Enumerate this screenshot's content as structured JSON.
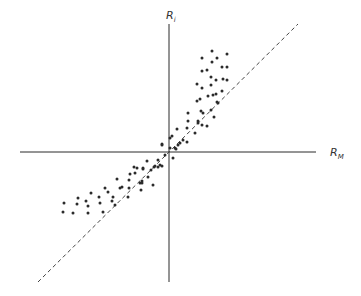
{
  "chart_data": {
    "type": "scatter",
    "title": "",
    "xlabel": "R",
    "xlabel_sub": "M",
    "ylabel": "R",
    "ylabel_sub": "i",
    "xlim": [
      -14.9,
      14.7
    ],
    "ylim": [
      -13.0,
      12.8
    ],
    "grid": false,
    "legend": "none",
    "fit_line": {
      "style": "dashed",
      "from": [
        -13.1,
        -13.0
      ],
      "to": [
        12.9,
        12.8
      ]
    },
    "series": [
      {
        "name": "observations",
        "points": [
          [
            4.3,
            10.1
          ],
          [
            3.3,
            9.4
          ],
          [
            4.8,
            9.4
          ],
          [
            5.8,
            9.8
          ],
          [
            4.3,
            9.0
          ],
          [
            3.3,
            8.1
          ],
          [
            3.8,
            8.2
          ],
          [
            5.3,
            8.5
          ],
          [
            5.8,
            8.5
          ],
          [
            4.2,
            7.5
          ],
          [
            4.7,
            7.2
          ],
          [
            5.4,
            7.3
          ],
          [
            5.8,
            7.2
          ],
          [
            2.8,
            6.8
          ],
          [
            4.2,
            6.7
          ],
          [
            3.3,
            6.4
          ],
          [
            5.3,
            6.1
          ],
          [
            4.7,
            5.8
          ],
          [
            3.9,
            5.6
          ],
          [
            4.4,
            5.7
          ],
          [
            2.8,
            5.1
          ],
          [
            3.1,
            5.3
          ],
          [
            4.8,
            5.0
          ],
          [
            4.9,
            4.9
          ],
          [
            4.2,
            4.2
          ],
          [
            1.9,
            3.9
          ],
          [
            3.2,
            4.1
          ],
          [
            3.4,
            3.9
          ],
          [
            4.5,
            3.5
          ],
          [
            1.9,
            3.1
          ],
          [
            2.9,
            3.1
          ],
          [
            3.3,
            2.7
          ],
          [
            3.8,
            2.6
          ],
          [
            2.9,
            2.9
          ],
          [
            1.8,
            2.4
          ],
          [
            0.8,
            2.3
          ],
          [
            2.6,
            1.9
          ],
          [
            0.3,
            1.6
          ],
          [
            0.1,
            1.4
          ],
          [
            1.4,
            1.2
          ],
          [
            1.8,
            1.0
          ],
          [
            -0.7,
            0.8
          ],
          [
            0.9,
            0.7
          ],
          [
            1.1,
            0.9
          ],
          [
            0.1,
            0.4
          ],
          [
            0.6,
            0.4
          ],
          [
            0.7,
            0.3
          ],
          [
            -0.7,
            0.7
          ],
          [
            -0.4,
            -0.3
          ],
          [
            0.4,
            -0.6
          ],
          [
            -1.1,
            -0.8
          ],
          [
            -2.2,
            -0.9
          ],
          [
            -1.5,
            -1.5
          ],
          [
            -1.1,
            -1.5
          ],
          [
            -1.8,
            -1.8
          ],
          [
            -0.7,
            -1.4
          ],
          [
            -3.2,
            -1.6
          ],
          [
            -2.6,
            -1.7
          ],
          [
            -1.6,
            -3.3
          ],
          [
            -2.7,
            -2.9
          ],
          [
            -2.9,
            -3.1
          ],
          [
            -2.1,
            -2.5
          ],
          [
            -0.9,
            -1.3
          ],
          [
            -1.4,
            -1.4
          ],
          [
            -3.5,
            -1.5
          ],
          [
            -2.6,
            -1.6
          ],
          [
            -3.4,
            -2.1
          ],
          [
            -3.9,
            -2.2
          ],
          [
            -5.2,
            -2.7
          ],
          [
            -4.0,
            -2.8
          ],
          [
            -2.7,
            -3.1
          ],
          [
            -6.4,
            -3.6
          ],
          [
            -6.1,
            -4.0
          ],
          [
            -4.9,
            -3.6
          ],
          [
            -4.7,
            -3.5
          ],
          [
            -4.0,
            -3.6
          ],
          [
            -2.8,
            -3.8
          ],
          [
            -7.8,
            -4.1
          ],
          [
            -9.1,
            -4.6
          ],
          [
            -7.0,
            -4.5
          ],
          [
            -5.6,
            -4.5
          ],
          [
            -4.1,
            -4.5
          ],
          [
            -10.5,
            -5.1
          ],
          [
            -9.2,
            -5.2
          ],
          [
            -8.3,
            -4.9
          ],
          [
            -6.9,
            -5.1
          ],
          [
            -5.7,
            -4.9
          ],
          [
            -5.4,
            -5.3
          ],
          [
            -8.1,
            -5.4
          ],
          [
            -10.6,
            -6.0
          ],
          [
            -9.6,
            -6.1
          ],
          [
            -8.1,
            -6.1
          ],
          [
            -6.6,
            -6.0
          ]
        ]
      }
    ]
  }
}
